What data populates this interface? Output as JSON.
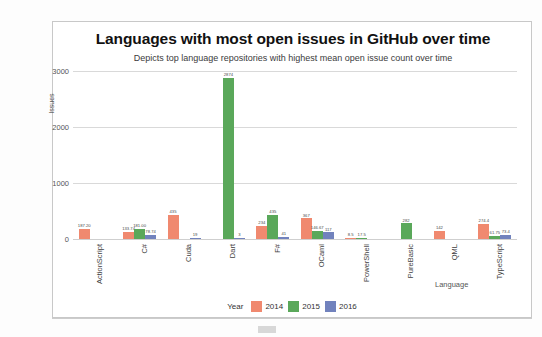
{
  "chart_data": {
    "type": "bar",
    "title": "Languages with most open issues in GitHub over time",
    "subtitle": "Depicts top language repositories with highest mean open issue count over time",
    "xlabel": "Language",
    "ylabel": "Issues",
    "ylim": [
      0,
      3000
    ],
    "yticks": [
      "0",
      "1000",
      "2000",
      "3000"
    ],
    "grid": true,
    "legend_title": "Year",
    "legend_position": "bottom",
    "categories": [
      "ActionScript",
      "C#",
      "Cuda",
      "Dart",
      "F#",
      "OCaml",
      "PowerShell",
      "PureBasic",
      "QML",
      "TypeScript"
    ],
    "series": [
      {
        "name": "2014",
        "color": "#f0896f",
        "values": [
          187.2,
          133.74,
          435,
          null,
          234,
          367,
          8.5,
          null,
          142,
          274.4
        ],
        "labels": [
          "187.20",
          "133.74",
          "435",
          "",
          "234",
          "367",
          "8.5",
          "",
          "142",
          "274.4"
        ]
      },
      {
        "name": "2015",
        "color": "#5aa85a",
        "values": [
          null,
          181.0,
          null,
          2874,
          435,
          146.67,
          17.5,
          282,
          null,
          61.75
        ],
        "labels": [
          "",
          "181.00",
          "",
          "2874",
          "435",
          "146.67",
          "17.5",
          "282",
          "",
          "61.75"
        ]
      },
      {
        "name": "2016",
        "color": "#7182bd",
        "values": [
          null,
          78.74,
          19,
          3,
          41,
          117,
          null,
          null,
          null,
          73.4
        ],
        "labels": [
          "",
          "78.74",
          "19",
          "3",
          "41",
          "117",
          "",
          "",
          "",
          "73.4"
        ]
      }
    ]
  }
}
